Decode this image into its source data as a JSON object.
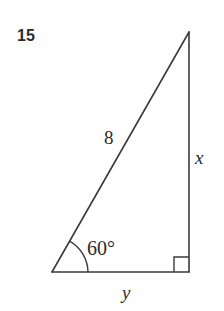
{
  "figure": {
    "problem_number": "15",
    "shape": "right-triangle",
    "labels": {
      "hypotenuse": "8",
      "opposite_side": "x",
      "adjacent_side": "y",
      "angle": "60°",
      "right_angle_marker": "right-angle"
    },
    "colors": {
      "background": "#ffffff",
      "stroke": "#3a3a3a",
      "text": "#2b2b2b"
    },
    "geometry": {
      "apex": [
        189,
        32
      ],
      "bottom_left": [
        52,
        272
      ],
      "bottom_right": [
        189,
        272
      ],
      "arc_radius": 36,
      "right_angle_size": 15
    }
  }
}
